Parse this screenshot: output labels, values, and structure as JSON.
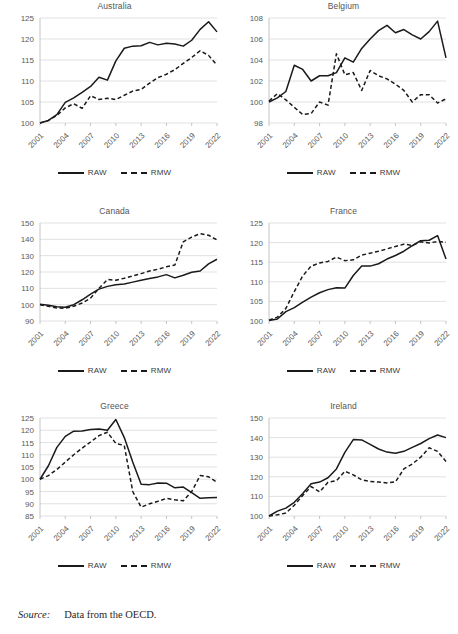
{
  "figure": {
    "source_label": "Source:",
    "source_text": "Data from the OECD.",
    "legend": {
      "raw": "RAW",
      "rmw": "RMW"
    }
  },
  "chart_data": [
    {
      "type": "line",
      "title": "Australia",
      "xlabel": "",
      "ylabel": "",
      "grid": true,
      "legend_position": "bottom",
      "x": [
        2001,
        2002,
        2003,
        2004,
        2005,
        2006,
        2007,
        2008,
        2009,
        2010,
        2011,
        2012,
        2013,
        2014,
        2015,
        2016,
        2017,
        2018,
        2019,
        2020,
        2021,
        2022
      ],
      "xticks": [
        2001,
        2004,
        2007,
        2010,
        2013,
        2016,
        2019,
        2022
      ],
      "yticks": [
        100,
        105,
        110,
        115,
        120,
        125
      ],
      "ylim": [
        100,
        125
      ],
      "series": [
        {
          "name": "RAW",
          "style": "solid",
          "values": [
            100.0,
            100.6,
            102.0,
            104.9,
            106.0,
            107.3,
            108.7,
            110.9,
            110.2,
            114.8,
            117.8,
            118.3,
            118.4,
            119.2,
            118.6,
            119.0,
            118.8,
            118.3,
            119.7,
            122.3,
            124.1,
            121.7
          ]
        },
        {
          "name": "RMW",
          "style": "dashed",
          "values": [
            100.0,
            100.6,
            101.8,
            103.6,
            104.6,
            103.5,
            106.5,
            105.6,
            105.9,
            105.6,
            106.6,
            107.6,
            108.0,
            109.5,
            110.8,
            111.6,
            112.7,
            114.2,
            115.6,
            117.2,
            116.1,
            113.8
          ]
        }
      ]
    },
    {
      "type": "line",
      "title": "Belgium",
      "xlabel": "",
      "ylabel": "",
      "grid": true,
      "legend_position": "bottom",
      "x": [
        2001,
        2002,
        2003,
        2004,
        2005,
        2006,
        2007,
        2008,
        2009,
        2010,
        2011,
        2012,
        2013,
        2014,
        2015,
        2016,
        2017,
        2018,
        2019,
        2020,
        2021,
        2022
      ],
      "xticks": [
        2001,
        2004,
        2007,
        2010,
        2013,
        2016,
        2019,
        2022
      ],
      "yticks": [
        98,
        100,
        102,
        104,
        106,
        108
      ],
      "ylim": [
        98,
        108
      ],
      "series": [
        {
          "name": "RAW",
          "style": "solid",
          "values": [
            100.0,
            100.4,
            101.0,
            103.5,
            103.1,
            102.0,
            102.5,
            102.5,
            102.8,
            104.2,
            103.8,
            105.1,
            106.0,
            106.8,
            107.3,
            106.6,
            106.9,
            106.4,
            106.0,
            106.7,
            107.7,
            104.2
          ]
        },
        {
          "name": "RMW",
          "style": "dashed",
          "values": [
            100.1,
            100.8,
            100.2,
            99.5,
            98.8,
            98.9,
            100.0,
            99.7,
            104.6,
            102.6,
            102.8,
            101.1,
            103.0,
            102.5,
            102.2,
            101.7,
            101.1,
            100.0,
            100.7,
            100.7,
            99.9,
            100.3
          ]
        }
      ]
    },
    {
      "type": "line",
      "title": "Canada",
      "xlabel": "",
      "ylabel": "",
      "grid": true,
      "legend_position": "bottom",
      "x": [
        2001,
        2002,
        2003,
        2004,
        2005,
        2006,
        2007,
        2008,
        2009,
        2010,
        2011,
        2012,
        2013,
        2014,
        2015,
        2016,
        2017,
        2018,
        2019,
        2020,
        2021,
        2022
      ],
      "xticks": [
        2001,
        2004,
        2007,
        2010,
        2013,
        2016,
        2019,
        2022
      ],
      "yticks": [
        90,
        100,
        110,
        120,
        130,
        140,
        150
      ],
      "ylim": [
        90,
        150
      ],
      "series": [
        {
          "name": "RAW",
          "style": "solid",
          "values": [
            100.2,
            99.6,
            98.7,
            98.4,
            100.0,
            103.0,
            106.5,
            109.5,
            111.2,
            112.2,
            112.6,
            113.8,
            115.0,
            116.0,
            117.0,
            118.4,
            116.4,
            118.0,
            119.8,
            120.6,
            125.0,
            127.8
          ]
        },
        {
          "name": "RMW",
          "style": "dashed",
          "values": [
            100.0,
            99.0,
            98.0,
            97.8,
            99.0,
            101.0,
            104.0,
            110.0,
            115.4,
            115.0,
            116.2,
            117.6,
            119.0,
            120.6,
            121.7,
            123.2,
            124.3,
            138.5,
            141.4,
            143.4,
            142.5,
            139.6
          ]
        }
      ]
    },
    {
      "type": "line",
      "title": "France",
      "xlabel": "",
      "ylabel": "",
      "grid": true,
      "legend_position": "bottom",
      "x": [
        2001,
        2002,
        2003,
        2004,
        2005,
        2006,
        2007,
        2008,
        2009,
        2010,
        2011,
        2012,
        2013,
        2014,
        2015,
        2016,
        2017,
        2018,
        2019,
        2020,
        2021,
        2022
      ],
      "xticks": [
        2001,
        2004,
        2007,
        2010,
        2013,
        2016,
        2019,
        2022
      ],
      "yticks": [
        100,
        105,
        110,
        115,
        120,
        125
      ],
      "ylim": [
        100,
        125
      ],
      "series": [
        {
          "name": "RAW",
          "style": "solid",
          "values": [
            100.1,
            100.5,
            102.4,
            103.4,
            104.8,
            106.1,
            107.2,
            108.0,
            108.5,
            108.4,
            111.6,
            114.0,
            114.0,
            114.6,
            115.8,
            116.7,
            117.8,
            119.2,
            120.5,
            120.6,
            121.8,
            115.8
          ]
        },
        {
          "name": "RMW",
          "style": "dashed",
          "values": [
            100.2,
            101.0,
            103.2,
            107.5,
            111.5,
            114.0,
            114.8,
            115.2,
            116.3,
            115.4,
            115.6,
            116.8,
            117.3,
            117.8,
            118.4,
            119.0,
            119.6,
            119.3,
            120.2,
            119.9,
            120.3,
            120.1
          ]
        }
      ]
    },
    {
      "type": "line",
      "title": "Greece",
      "xlabel": "",
      "ylabel": "",
      "grid": true,
      "legend_position": "bottom",
      "x": [
        2001,
        2002,
        2003,
        2004,
        2005,
        2006,
        2007,
        2008,
        2009,
        2010,
        2011,
        2012,
        2013,
        2014,
        2015,
        2016,
        2017,
        2018,
        2019,
        2020,
        2021,
        2022
      ],
      "xticks": [
        2001,
        2004,
        2007,
        2010,
        2013,
        2016,
        2019,
        2022
      ],
      "yticks": [
        85,
        90,
        95,
        100,
        105,
        110,
        115,
        120,
        125
      ],
      "ylim": [
        85,
        125
      ],
      "series": [
        {
          "name": "RAW",
          "style": "solid",
          "values": [
            100.0,
            105.5,
            113.0,
            117.5,
            119.6,
            119.7,
            120.3,
            120.5,
            120.0,
            124.4,
            117.0,
            107.0,
            98.0,
            97.8,
            98.5,
            98.4,
            96.5,
            96.8,
            94.5,
            92.2,
            92.4,
            92.6
          ]
        },
        {
          "name": "RMW",
          "style": "dashed",
          "values": [
            100.0,
            101.5,
            104.0,
            107.0,
            110.0,
            112.7,
            115.2,
            117.8,
            119.2,
            114.6,
            113.8,
            95.0,
            88.6,
            90.0,
            91.0,
            92.2,
            91.6,
            91.2,
            95.0,
            101.5,
            101.0,
            98.8
          ]
        }
      ]
    },
    {
      "type": "line",
      "title": "Ireland",
      "xlabel": "",
      "ylabel": "",
      "grid": true,
      "legend_position": "bottom",
      "x": [
        2001,
        2002,
        2003,
        2004,
        2005,
        2006,
        2007,
        2008,
        2009,
        2010,
        2011,
        2012,
        2013,
        2014,
        2015,
        2016,
        2017,
        2018,
        2019,
        2020,
        2021,
        2022
      ],
      "xticks": [
        2001,
        2004,
        2007,
        2010,
        2013,
        2016,
        2019,
        2022
      ],
      "yticks": [
        100,
        110,
        120,
        130,
        140,
        150
      ],
      "ylim": [
        100,
        150
      ],
      "series": [
        {
          "name": "RAW",
          "style": "solid",
          "values": [
            100.0,
            102.5,
            104.0,
            107.0,
            111.5,
            116.5,
            117.3,
            119.5,
            124.0,
            132.5,
            139.0,
            138.8,
            136.5,
            134.2,
            132.6,
            132.0,
            133.0,
            135.0,
            137.0,
            139.5,
            141.3,
            140.0
          ]
        },
        {
          "name": "RMW",
          "style": "dashed",
          "values": [
            100.0,
            100.6,
            101.5,
            105.5,
            110.5,
            115.0,
            112.3,
            117.2,
            118.0,
            122.8,
            121.0,
            118.5,
            117.6,
            117.3,
            116.9,
            117.4,
            124.0,
            126.5,
            130.0,
            134.8,
            133.0,
            127.8
          ]
        }
      ]
    }
  ]
}
